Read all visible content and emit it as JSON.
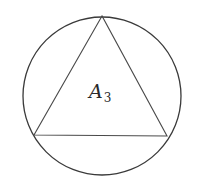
{
  "diagram": {
    "label": {
      "main": "A",
      "subscript": "3"
    },
    "shapes": {
      "circle": {
        "cx": 102,
        "cy": 96,
        "r": 79
      },
      "triangle": {
        "points": "102,16 34,135 167,136"
      }
    },
    "colors": {
      "stroke": "#3a3a3a",
      "background": "#ffffff"
    }
  }
}
